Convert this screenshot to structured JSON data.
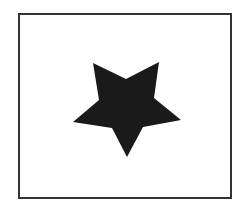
{
  "figure": {
    "frame": {
      "x": 18,
      "y": 13,
      "width": 214,
      "height": 186,
      "stroke": "#333333",
      "fill": "#ffffff"
    },
    "shape": {
      "type": "five-pointed-star",
      "orientation": "inverted",
      "fill": "#1a1a1a",
      "points": "93,63 126,79 159,62 154,98 181,120 143,127 127,157 112,128 73,122 99,100"
    }
  }
}
